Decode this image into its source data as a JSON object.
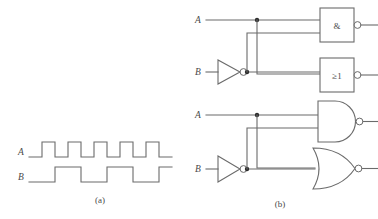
{
  "figure": {
    "panels": [
      {
        "id": "a",
        "caption": "(a)",
        "kind": "timing-waveform-diagram"
      },
      {
        "id": "b",
        "caption": "(b)",
        "kind": "logic-gate-circuit-diagram"
      }
    ]
  },
  "panel_a": {
    "caption": "(a)",
    "signals": [
      {
        "label": "A",
        "name": "waveform-a",
        "description": "square wave, 5 pulses, 50% duty cycle",
        "pulse_count": 5,
        "levels": [
          0,
          1,
          0,
          1,
          0,
          1,
          0,
          1,
          0,
          1,
          0
        ]
      },
      {
        "label": "B",
        "name": "waveform-b",
        "description": "square wave at half the frequency of A",
        "pulse_count": 3,
        "levels": [
          0,
          1,
          0,
          1,
          0,
          1
        ]
      }
    ]
  },
  "panel_b": {
    "caption": "(b)",
    "inputs_iec": [
      {
        "label": "A",
        "name": "input-a-iec"
      },
      {
        "label": "B",
        "name": "input-b-iec"
      }
    ],
    "inputs_ansi": [
      {
        "label": "A",
        "name": "input-a-ansi"
      },
      {
        "label": "B",
        "name": "input-b-ansi"
      }
    ],
    "gates": [
      {
        "name": "iec-nand-gate",
        "symbol": "&",
        "notation": "IEC",
        "function": "NAND",
        "inverted_output": true
      },
      {
        "name": "iec-nor-gate",
        "symbol": "≥1",
        "notation": "IEC",
        "function": "NOR",
        "inverted_output": true
      },
      {
        "name": "inverter-b-iec",
        "symbol": "",
        "notation": "IEC",
        "function": "NOT",
        "inverted_output": true
      },
      {
        "name": "ansi-nand-gate",
        "symbol": "",
        "notation": "ANSI",
        "function": "NAND",
        "inverted_output": true
      },
      {
        "name": "ansi-nor-gate",
        "symbol": "",
        "notation": "ANSI",
        "function": "NOR",
        "inverted_output": true
      },
      {
        "name": "inverter-b-ansi",
        "symbol": "",
        "notation": "ANSI",
        "function": "NOT",
        "inverted_output": true
      }
    ]
  },
  "colors": {
    "line": "#6b6b6b",
    "junction": "#2e2e2e",
    "text": "#4a4a4a",
    "background": "#ffffff"
  }
}
